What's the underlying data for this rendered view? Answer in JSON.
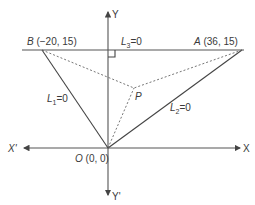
{
  "diagram": {
    "axes": {
      "x_label": "X",
      "x_neg_label": "X'",
      "y_label": "Y",
      "y_neg_label": "Y'"
    },
    "points": {
      "origin": {
        "name": "O",
        "coords": "(0, 0)"
      },
      "B": {
        "name": "B",
        "coords": "(−20, 15)"
      },
      "A": {
        "name": "A",
        "coords": "(36, 15)"
      },
      "P": {
        "name": "P"
      }
    },
    "lines": {
      "L1": {
        "name": "L",
        "sub": "1",
        "eq": "=0"
      },
      "L2": {
        "name": "L",
        "sub": "2",
        "eq": "=0"
      },
      "L3": {
        "name": "L",
        "sub": "3",
        "eq": "=0"
      }
    },
    "colors": {
      "stroke": "#444444",
      "text": "#3a3a3a"
    }
  }
}
